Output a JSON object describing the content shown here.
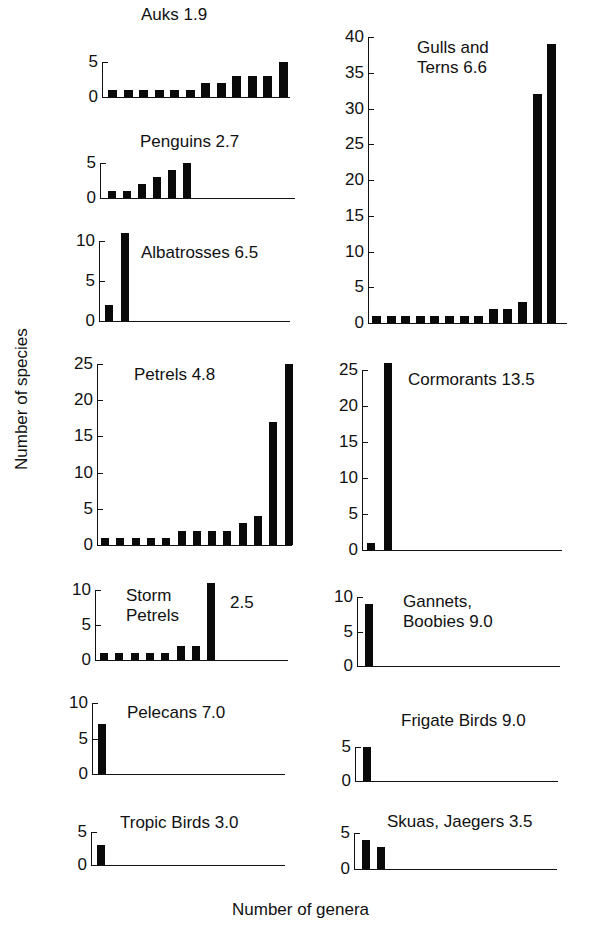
{
  "axis_labels": {
    "y": "Number of species",
    "x": "Number of genera"
  },
  "chart_data": [
    {
      "type": "bar",
      "title": "Auks 1.9",
      "xlabel": "Number of genera",
      "ylabel": "Number of species",
      "yticks": [
        0,
        5
      ],
      "ylim": [
        0,
        5
      ],
      "values": [
        1,
        1,
        1,
        1,
        1,
        1,
        2,
        2,
        3,
        3,
        3,
        5
      ]
    },
    {
      "type": "bar",
      "title": "Penguins 2.7",
      "xlabel": "Number of genera",
      "ylabel": "Number of species",
      "yticks": [
        0,
        5
      ],
      "ylim": [
        0,
        5
      ],
      "values": [
        1,
        1,
        2,
        3,
        4,
        5
      ]
    },
    {
      "type": "bar",
      "title": "Albatrosses 6.5",
      "xlabel": "Number of genera",
      "ylabel": "Number of species",
      "yticks": [
        0,
        5,
        10
      ],
      "ylim": [
        0,
        10
      ],
      "values": [
        2,
        11
      ]
    },
    {
      "type": "bar",
      "title": "Gulls and\nTerns 6.6",
      "xlabel": "Number of genera",
      "ylabel": "Number of species",
      "yticks": [
        0,
        5,
        10,
        15,
        20,
        25,
        30,
        35,
        40
      ],
      "ylim": [
        0,
        40
      ],
      "values": [
        1,
        1,
        1,
        1,
        1,
        1,
        1,
        1,
        2,
        2,
        3,
        32,
        39
      ]
    },
    {
      "type": "bar",
      "title": "Petrels 4.8",
      "xlabel": "Number of genera",
      "ylabel": "Number of species",
      "yticks": [
        0,
        5,
        10,
        15,
        20,
        25
      ],
      "ylim": [
        0,
        25
      ],
      "values": [
        1,
        1,
        1,
        1,
        1,
        2,
        2,
        2,
        2,
        3,
        4,
        17,
        25
      ]
    },
    {
      "type": "bar",
      "title": "Cormorants 13.5",
      "xlabel": "Number of genera",
      "ylabel": "Number of species",
      "yticks": [
        0,
        5,
        10,
        15,
        20,
        25
      ],
      "ylim": [
        0,
        25
      ],
      "values": [
        1,
        26
      ]
    },
    {
      "type": "bar",
      "title": "Storm\nPetrels",
      "annotation": "2.5",
      "xlabel": "Number of genera",
      "ylabel": "Number of species",
      "yticks": [
        0,
        5,
        10
      ],
      "ylim": [
        0,
        10
      ],
      "values": [
        1,
        1,
        1,
        1,
        1,
        2,
        2,
        11
      ]
    },
    {
      "type": "bar",
      "title": "Gannets,\nBoobies 9.0",
      "xlabel": "Number of genera",
      "ylabel": "Number of species",
      "yticks": [
        0,
        5,
        10
      ],
      "ylim": [
        0,
        10
      ],
      "values": [
        9
      ]
    },
    {
      "type": "bar",
      "title": "Pelecans 7.0",
      "xlabel": "Number of genera",
      "ylabel": "Number of species",
      "yticks": [
        0,
        5,
        10
      ],
      "ylim": [
        0,
        10
      ],
      "values": [
        7
      ]
    },
    {
      "type": "bar",
      "title": "Frigate Birds 9.0",
      "xlabel": "Number of genera",
      "ylabel": "Number of species",
      "yticks": [
        0,
        5
      ],
      "ylim": [
        0,
        5
      ],
      "values": [
        5
      ]
    },
    {
      "type": "bar",
      "title": "Tropic Birds 3.0",
      "xlabel": "Number of genera",
      "ylabel": "Number of species",
      "yticks": [
        0,
        5
      ],
      "ylim": [
        0,
        5
      ],
      "values": [
        3
      ]
    },
    {
      "type": "bar",
      "title": "Skuas, Jaegers 3.5",
      "xlabel": "Number of genera",
      "ylabel": "Number of species",
      "yticks": [
        0,
        5
      ],
      "ylim": [
        0,
        5
      ],
      "values": [
        4,
        3
      ]
    }
  ],
  "layout": [
    {
      "axisX": 102,
      "topY": 62,
      "zeroY": 97,
      "xEnd": 290,
      "firstBarX": 108,
      "barW": 9,
      "step": 15.5,
      "titleX": 141,
      "titleY": 5
    },
    {
      "axisX": 100,
      "topY": 163,
      "zeroY": 198,
      "xEnd": 295,
      "firstBarX": 108,
      "barW": 8,
      "step": 15,
      "titleX": 140,
      "titleY": 132
    },
    {
      "axisX": 99,
      "topY": 241,
      "zeroY": 321,
      "xEnd": 290,
      "firstBarX": 105,
      "barW": 8,
      "step": 16,
      "titleX": 141,
      "titleY": 243
    },
    {
      "axisX": 368,
      "topY": 37,
      "zeroY": 323,
      "xEnd": 567,
      "firstBarX": 372,
      "barW": 9,
      "step": 14.6,
      "titleX": 417,
      "titleY": 38
    },
    {
      "axisX": 97,
      "topY": 364,
      "zeroY": 545,
      "xEnd": 292,
      "firstBarX": 101,
      "barW": 8,
      "step": 15.3,
      "titleX": 134,
      "titleY": 365
    },
    {
      "axisX": 362,
      "topY": 370,
      "zeroY": 550,
      "xEnd": 562,
      "firstBarX": 367,
      "barW": 8,
      "step": 17,
      "titleX": 408,
      "titleY": 370
    },
    {
      "axisX": 95,
      "topY": 590,
      "zeroY": 660,
      "xEnd": 288,
      "firstBarX": 100,
      "barW": 8,
      "step": 15.3,
      "titleX": 126,
      "titleY": 586,
      "annotX": 230,
      "annotY": 593
    },
    {
      "axisX": 357,
      "topY": 597,
      "zeroY": 666,
      "xEnd": 560,
      "firstBarX": 365,
      "barW": 8,
      "step": 15,
      "titleX": 403,
      "titleY": 592
    },
    {
      "axisX": 92,
      "topY": 703,
      "zeroY": 774,
      "xEnd": 285,
      "firstBarX": 98,
      "barW": 8,
      "step": 15,
      "titleX": 127,
      "titleY": 703
    },
    {
      "axisX": 355,
      "topY": 747,
      "zeroY": 781,
      "xEnd": 558,
      "firstBarX": 363,
      "barW": 8,
      "step": 15,
      "titleX": 401,
      "titleY": 711
    },
    {
      "axisX": 91,
      "topY": 832,
      "zeroY": 865,
      "xEnd": 285,
      "firstBarX": 97,
      "barW": 8,
      "step": 15,
      "titleX": 120,
      "titleY": 813
    },
    {
      "axisX": 354,
      "topY": 833,
      "zeroY": 869,
      "xEnd": 557,
      "firstBarX": 362,
      "barW": 8,
      "step": 15,
      "titleX": 387,
      "titleY": 812
    }
  ]
}
